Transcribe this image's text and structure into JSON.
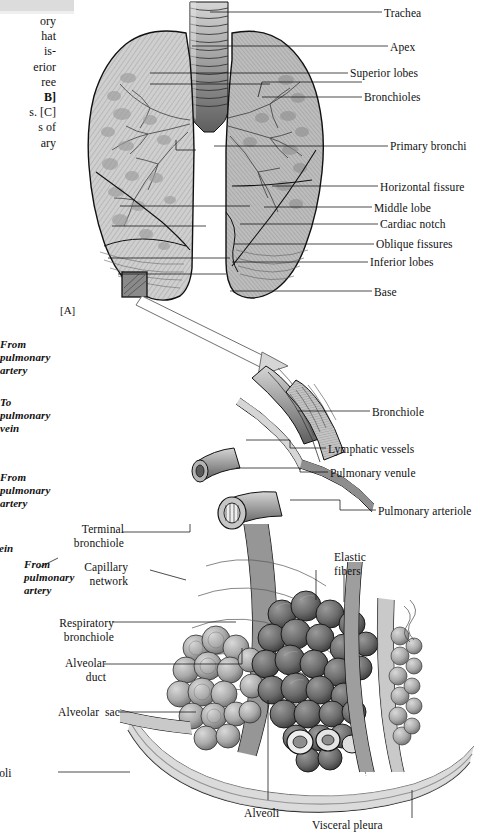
{
  "page": {
    "width": 484,
    "height": 827,
    "background": "#ffffff",
    "ink": "#111111",
    "fill_light": "#c9c9c9",
    "fill_mid": "#9a9a9a",
    "fill_dark": "#6e6e6e",
    "topbar_color": "#dcdcdc"
  },
  "body_text": {
    "lines": [
      "ory",
      "hat",
      "is-",
      "erior",
      "ree",
      "B]",
      "s. [C]",
      "s of",
      "ary"
    ],
    "note": "left body column clipped by screenshot edge"
  },
  "figure_a": {
    "panel_tag": "[A]",
    "title": "Lungs, anterior view",
    "labels_right": [
      {
        "text": "Trachea",
        "y": 12
      },
      {
        "text": "Apex",
        "y": 45
      },
      {
        "text": "Superior lobes",
        "y": 72
      },
      {
        "text": "Bronchioles",
        "y": 96
      },
      {
        "text": "Primary bronchi",
        "y": 145
      },
      {
        "text": "Horizontal fissure",
        "y": 186
      },
      {
        "text": "Middle lobe",
        "y": 207
      },
      {
        "text": "Cardiac notch",
        "y": 223
      },
      {
        "text": "Oblique fissures",
        "y": 243
      },
      {
        "text": "Inferior lobes",
        "y": 261
      },
      {
        "text": "Base",
        "y": 290
      }
    ]
  },
  "figure_b": {
    "title": "Alveolar unit detail",
    "labels_right": [
      {
        "text": "Bronchiole",
        "y": 411
      },
      {
        "text": "Lymphatic vessels",
        "y": 448
      },
      {
        "text": "Pulmonary venule",
        "y": 472
      },
      {
        "text": "Pulmonary arteriole",
        "y": 510
      }
    ],
    "labels_left_italic": [
      {
        "text": "From\npulmonary\nartery",
        "y": 345
      },
      {
        "text": "To\npulmonary\nvein",
        "y": 403
      },
      {
        "text": "From\npulmonary\nartery",
        "y": 478
      },
      {
        "text": "vein",
        "y": 548
      },
      {
        "text": "From\npulmonary\nartery",
        "y": 565
      }
    ],
    "labels_left_plain": [
      {
        "text": "Terminal\nbronchiole",
        "y": 528
      },
      {
        "text": "Capillary\nnetwork",
        "y": 566
      },
      {
        "text": "Respiratory\nbronchiole",
        "y": 622
      },
      {
        "text": "Alveolar\nduct",
        "y": 662
      },
      {
        "text": "Alveolar  sac",
        "y": 710
      },
      {
        "text": "eoli",
        "y": 772
      }
    ],
    "labels_inner": [
      {
        "text": "Elastic\nfibers",
        "y": 556
      }
    ],
    "labels_bottom": [
      {
        "text": "Alveoli",
        "y": 812
      },
      {
        "text": "Visceral pleura",
        "y": 824
      }
    ]
  },
  "callout": {
    "source_box": "magnified region on left lung base",
    "arrow": "arrow-from-lung-to-detail"
  }
}
